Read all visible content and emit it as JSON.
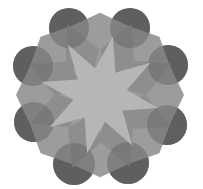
{
  "figure": {
    "width": 203,
    "height": 189,
    "center": [
      100,
      95
    ],
    "colors": {
      "background": "#ffffff",
      "circle": "#5f5f5f",
      "circle_overlap": "#7b7b7b",
      "base": "#9c9c9c",
      "petal": "#8e8e8e",
      "star": "#b6b6b6"
    },
    "circles": [
      {
        "cx": 69,
        "cy": 28,
        "r": 20
      },
      {
        "cx": 130,
        "cy": 28,
        "r": 20
      },
      {
        "cx": 168,
        "cy": 65,
        "r": 20
      },
      {
        "cx": 167,
        "cy": 125,
        "r": 20
      },
      {
        "cx": 128,
        "cy": 163,
        "r": 21
      },
      {
        "cx": 74,
        "cy": 164,
        "r": 21
      },
      {
        "cx": 34,
        "cy": 122,
        "r": 20
      },
      {
        "cx": 33,
        "cy": 66,
        "r": 20
      }
    ],
    "star_points": 8,
    "circle_count": 8
  }
}
